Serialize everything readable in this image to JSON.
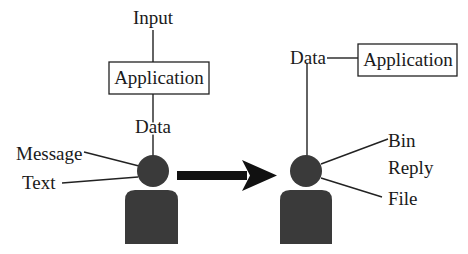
{
  "left": {
    "input_label": "Input",
    "application_label": "Application",
    "data_label": "Data",
    "message_label": "Message",
    "text_label": "Text"
  },
  "right": {
    "data_label": "Data",
    "application_label": "Application",
    "bin_label": "Bin",
    "reply_label": "Reply",
    "file_label": "File"
  },
  "colors": {
    "figure": "#3a3a3a",
    "line": "#222222",
    "background": "#ffffff"
  }
}
